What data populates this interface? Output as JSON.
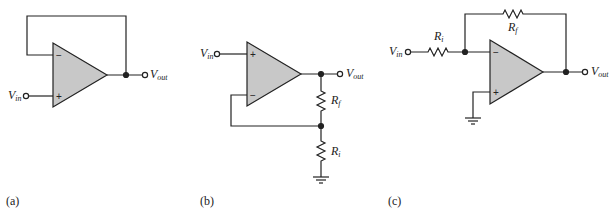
{
  "figure": {
    "circuits": [
      {
        "id": "a",
        "caption": "(a)",
        "name": "voltage-follower",
        "input_label": "V",
        "input_sub": "in",
        "output_label": "V",
        "output_sub": "out",
        "inverting_sign": "−",
        "noninverting_sign": "+"
      },
      {
        "id": "b",
        "caption": "(b)",
        "name": "noninverting-amplifier",
        "input_label": "V",
        "input_sub": "in",
        "output_label": "V",
        "output_sub": "out",
        "inverting_sign": "−",
        "noninverting_sign": "+",
        "rf_label": "R",
        "rf_sub": "f",
        "ri_label": "R",
        "ri_sub": "i"
      },
      {
        "id": "c",
        "caption": "(c)",
        "name": "inverting-amplifier",
        "input_label": "V",
        "input_sub": "in",
        "output_label": "V",
        "output_sub": "out",
        "inverting_sign": "−",
        "noninverting_sign": "+",
        "rf_label": "R",
        "rf_sub": "f",
        "ri_label": "R",
        "ri_sub": "i"
      }
    ],
    "colors": {
      "wire": "#222222",
      "opamp_fill": "#c8c8c8"
    }
  }
}
